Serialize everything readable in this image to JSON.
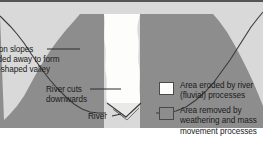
{
  "figure": {
    "title": "V-shaped valley formation cross-section",
    "width": 263,
    "height": 153
  },
  "colors": {
    "panel_background": "#d9d9d9",
    "weathering_area": "#8d8d8d",
    "fluvial_area": "#fdfdfb",
    "outline": "#3a3a3a",
    "border_top": "#555555",
    "text": "#1a1a1a"
  },
  "annotations": {
    "slopes": {
      "line1": "il on slopes",
      "line2": "oded away to form",
      "line3": "V-shaped valley"
    },
    "river_cuts": {
      "line1": "River cuts",
      "line2": "downwards"
    },
    "river": {
      "label": "River"
    }
  },
  "legend": {
    "items": [
      {
        "swatch": "white",
        "line1": "Area eroded by river",
        "line2": "(fluvial) processes"
      },
      {
        "swatch": "gray",
        "line1": "Area removed by",
        "line2": "weathering and mass",
        "line3": "movement processes"
      }
    ]
  }
}
